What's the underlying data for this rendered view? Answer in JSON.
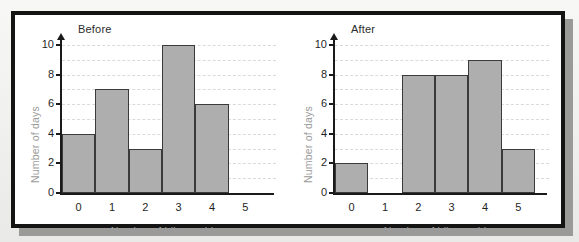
{
  "figure": {
    "frame_color": "#141414",
    "background_color": "#ffffff",
    "page_background_color": "#f2f2f1",
    "shadow_color": "#9a9a99"
  },
  "style": {
    "bar_fill": "#aeaeae",
    "bar_stroke": "#3a3a3a",
    "axis_color": "#1a1a1a",
    "grid_color": "#dadada",
    "axis_label_color": "#9b9b9b",
    "tick_label_color": "#1f1f1f",
    "title_color": "#2b2b2b"
  },
  "chart_data": [
    {
      "type": "bar",
      "title": "Before",
      "xlabel": "Number of bikes sold",
      "ylabel": "Number of days",
      "categories": [
        "0",
        "1",
        "2",
        "3",
        "4",
        "5"
      ],
      "values": [
        4,
        7,
        3,
        10,
        6,
        0
      ],
      "ylim": [
        0,
        10
      ],
      "yticks": [
        0,
        2,
        4,
        6,
        8,
        10
      ],
      "ytick_labels": [
        "0",
        "2",
        "4",
        "6",
        "8",
        "10"
      ],
      "gridlines": [
        1,
        2,
        3,
        4,
        5,
        6,
        7,
        8,
        9,
        10
      ],
      "grid": true,
      "legend": "none"
    },
    {
      "type": "bar",
      "title": "After",
      "xlabel": "Number of bikes sold",
      "ylabel": "Number of days",
      "categories": [
        "0",
        "1",
        "2",
        "3",
        "4",
        "5"
      ],
      "values": [
        2,
        0,
        8,
        8,
        9,
        3
      ],
      "ylim": [
        0,
        10
      ],
      "yticks": [
        0,
        2,
        4,
        6,
        8,
        10
      ],
      "ytick_labels": [
        "0",
        "2",
        "4",
        "6",
        "8",
        "10"
      ],
      "gridlines": [
        1,
        2,
        3,
        4,
        5,
        6,
        7,
        8,
        9,
        10
      ],
      "grid": true,
      "legend": "none"
    }
  ]
}
